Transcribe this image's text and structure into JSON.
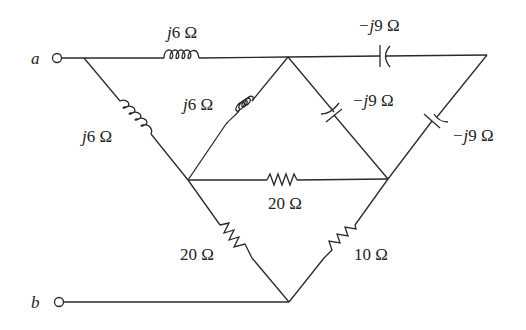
{
  "diagram": {
    "type": "circuit-schematic",
    "terminals": [
      {
        "id": "a",
        "label": "a"
      },
      {
        "id": "b",
        "label": "b"
      }
    ],
    "components": [
      {
        "id": "L_top",
        "kind": "inductor",
        "label": "j6 Ω",
        "prefix": "j",
        "value": "6 Ω",
        "between": [
          "a",
          "B"
        ]
      },
      {
        "id": "L_left",
        "kind": "inductor",
        "label": "j6 Ω",
        "prefix": "j",
        "value": "6 Ω",
        "between": [
          "a",
          "C"
        ]
      },
      {
        "id": "L_mid",
        "kind": "inductor",
        "label": "j6 Ω",
        "prefix": "j",
        "value": "6 Ω",
        "between": [
          "B",
          "C"
        ]
      },
      {
        "id": "C_top",
        "kind": "capacitor",
        "label": "−j9 Ω",
        "prefix": "−j",
        "value": "9 Ω",
        "between": [
          "B",
          "R"
        ]
      },
      {
        "id": "C_mid",
        "kind": "capacitor",
        "label": "−j9 Ω",
        "prefix": "−j",
        "value": "9 Ω",
        "between": [
          "B",
          "D"
        ]
      },
      {
        "id": "C_right",
        "kind": "capacitor",
        "label": "−j9 Ω",
        "prefix": "−j",
        "value": "9 Ω",
        "between": [
          "R",
          "D"
        ]
      },
      {
        "id": "R_mid",
        "kind": "resistor",
        "label": "20 Ω",
        "value": "20 Ω",
        "between": [
          "C",
          "D"
        ]
      },
      {
        "id": "R_left",
        "kind": "resistor",
        "label": "20 Ω",
        "value": "20 Ω",
        "between": [
          "C",
          "E"
        ]
      },
      {
        "id": "R_right",
        "kind": "resistor",
        "label": "10 Ω",
        "value": "10 Ω",
        "between": [
          "D",
          "E"
        ]
      }
    ],
    "labels": {
      "terminal_a": "a",
      "terminal_b": "b",
      "L_top_j": "j",
      "L_top_val": "6 Ω",
      "L_left_j": "j",
      "L_left_val": "6 Ω",
      "L_mid_j": "j",
      "L_mid_val": "6 Ω",
      "C_top_j": "−j",
      "C_top_val": "9 Ω",
      "C_mid_j": "−j",
      "C_mid_val": "9 Ω",
      "C_right_j": "−j",
      "C_right_val": "9 Ω",
      "R_mid_val": "20 Ω",
      "R_left_val": "20 Ω",
      "R_right_val": "10 Ω"
    }
  }
}
